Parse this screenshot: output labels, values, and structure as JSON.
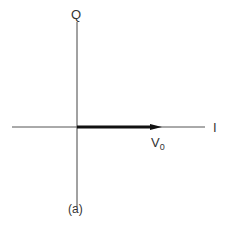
{
  "diagram": {
    "axes": {
      "vertical_label": "Q",
      "horizontal_label": "I"
    },
    "vector": {
      "label_main": "V",
      "label_sub": "0",
      "direction": "along +I axis"
    },
    "caption": "(a)",
    "colors": {
      "axis": "#444444",
      "vector": "#111111",
      "text": "#333333"
    }
  }
}
